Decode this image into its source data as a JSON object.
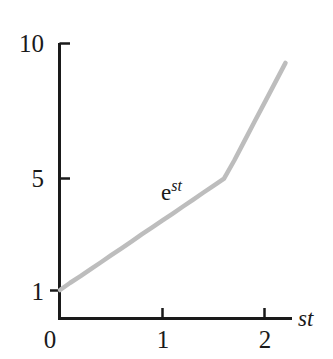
{
  "figure": {
    "background_color": "#ffffff",
    "axis_color": "#1a1a1a",
    "curve_color": "#bdbdbd",
    "text_color": "#1a1a1a"
  },
  "chart_data": {
    "type": "line",
    "title": "",
    "xlabel": "st",
    "ylabel": "",
    "y_scale": "log",
    "x_scale": "linear",
    "grid": false,
    "legend": "none",
    "xlim": [
      0,
      2.28
    ],
    "ylim": [
      0.78,
      10
    ],
    "x_ticks": [
      "0",
      "1",
      "2"
    ],
    "x_tick_values": [
      0,
      1,
      2
    ],
    "y_ticks": [
      "1",
      "5",
      "10"
    ],
    "y_tick_values": [
      1,
      5,
      10
    ],
    "origin_label": "0",
    "series": [
      {
        "name": "e^{st}",
        "label": "e",
        "label_exponent": "st",
        "color": "#bdbdbd",
        "line_width": 4.5,
        "x": [
          0.0,
          0.1,
          0.2,
          0.3,
          0.4,
          0.5,
          0.6,
          0.7,
          0.8,
          0.9,
          1.0,
          1.1,
          1.2,
          1.3,
          1.4,
          1.5,
          1.6,
          1.7,
          1.8,
          1.9,
          2.0,
          2.1,
          2.2
        ],
        "values": [
          1.0,
          1.11,
          1.22,
          1.35,
          1.49,
          1.65,
          1.82,
          2.01,
          2.23,
          2.46,
          2.72,
          3.0,
          3.32,
          3.67,
          4.06,
          4.48,
          4.95,
          5.47,
          6.05,
          6.69,
          7.39,
          8.17,
          9.03
        ]
      }
    ],
    "annotations": [
      {
        "text": "e^{st}",
        "x": 1.03,
        "y": 4.3
      }
    ]
  },
  "labels": {
    "y_10": "10",
    "y_5": "5",
    "y_1": "1",
    "x_0": "0",
    "x_1": "1",
    "x_2": "2",
    "x_axis_name": "st",
    "curve_base": "e",
    "curve_exponent": "st"
  }
}
